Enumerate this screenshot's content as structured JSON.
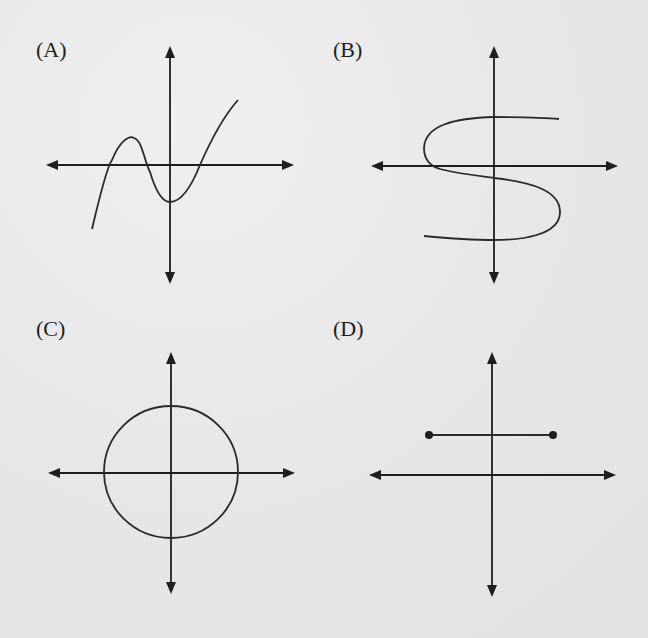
{
  "panels": [
    {
      "id": "A",
      "label": "(A)",
      "shape": "cubic-function-curve",
      "description": "Cubic curve with local max left of y-axis, local min just right of y-axis, three x-intercepts"
    },
    {
      "id": "B",
      "label": "(B)",
      "shape": "s-shaped-curve",
      "description": "Sideways S curve that crosses the y-axis at three points (fails vertical line test)"
    },
    {
      "id": "C",
      "label": "(C)",
      "shape": "circle",
      "description": "Circle centered at the origin"
    },
    {
      "id": "D",
      "label": "(D)",
      "shape": "horizontal-segment",
      "description": "Horizontal line segment above x-axis with closed endpoints"
    }
  ],
  "colors": {
    "ink": "#1e1e1e",
    "paper": "#e9e9e9"
  }
}
